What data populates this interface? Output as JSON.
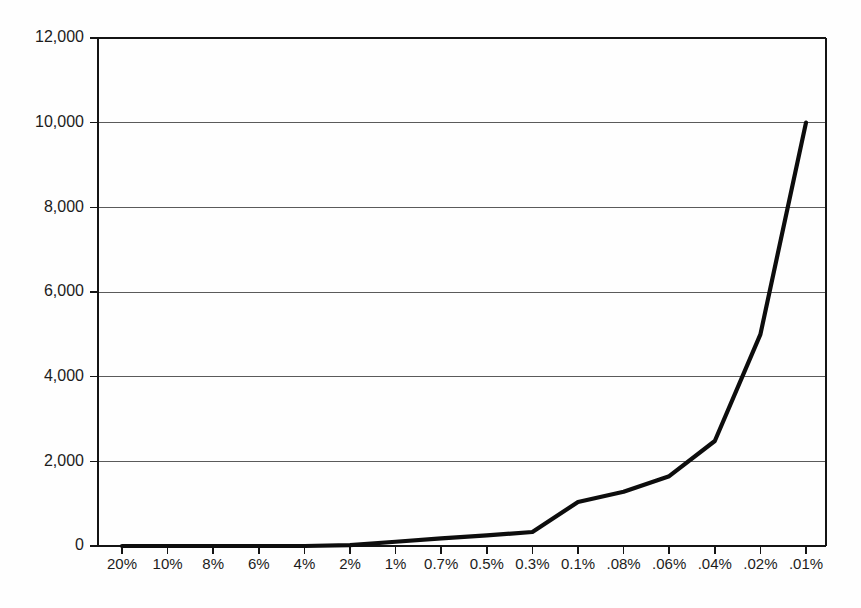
{
  "chart_data": {
    "type": "line",
    "title": "",
    "subtitle": "",
    "xlabel": "",
    "ylabel": "",
    "categories": [
      "20%",
      "10%",
      "8%",
      "6%",
      "4%",
      "2%",
      "1%",
      "0.7%",
      "0.5%",
      "0.3%",
      "0.1%",
      ".08%",
      ".06%",
      ".04%",
      ".02%",
      ".01%"
    ],
    "values": [
      0,
      0,
      0,
      0,
      0,
      20,
      100,
      180,
      250,
      330,
      1040,
      1280,
      1650,
      2480,
      5000,
      10000
    ],
    "series": [
      {
        "name": "",
        "values": [
          0,
          0,
          0,
          0,
          0,
          20,
          100,
          180,
          250,
          330,
          1040,
          1280,
          1650,
          2480,
          5000,
          10000
        ]
      }
    ],
    "ylim": [
      0,
      12000
    ],
    "yticks": [
      0,
      2000,
      4000,
      6000,
      8000,
      10000,
      12000
    ],
    "ytick_labels": [
      "0",
      "2,000",
      "4,000",
      "6,000",
      "8,000",
      "10,000",
      "12,000"
    ],
    "grid": true,
    "grid_axis": "y",
    "legend": false,
    "legend_position": "none",
    "line_color": "#0d0d0d",
    "grid_color": "#5a5a5a",
    "axis_color": "#141414",
    "background_color": "#fdfdfc",
    "annotations": []
  },
  "layout": {
    "plot_left": 98,
    "plot_right": 826,
    "plot_top": 38,
    "plot_bottom": 546,
    "first_tick_x": 122,
    "tick_spacing": 45.6,
    "xlabel_y": 558
  }
}
